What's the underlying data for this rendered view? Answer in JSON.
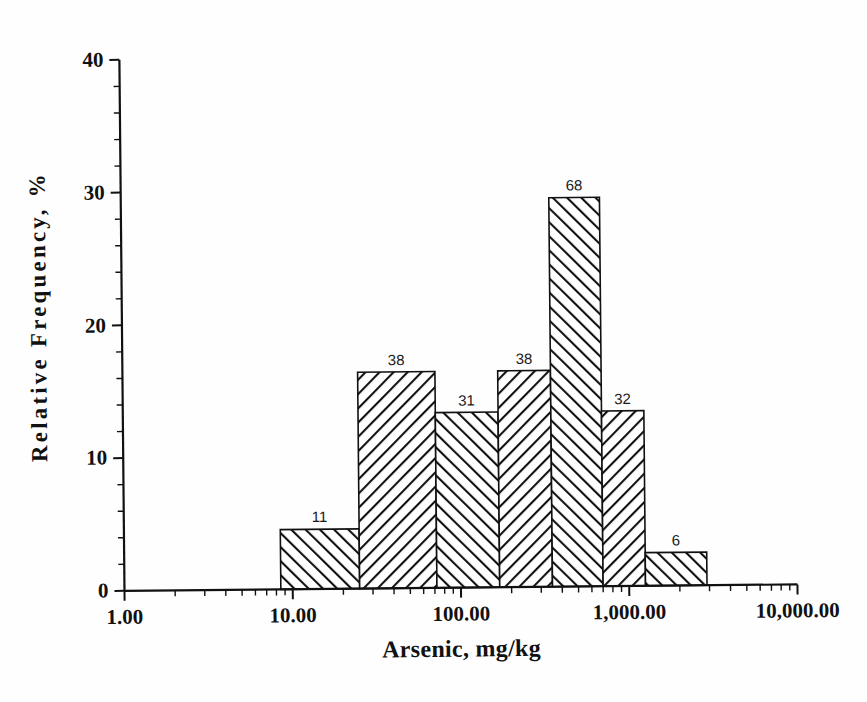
{
  "chart_data": {
    "type": "bar",
    "title": "",
    "xlabel": "Arsenic, mg/kg",
    "ylabel": "Relative Frequency, %",
    "xscale": "log",
    "xlim": [
      1,
      10000
    ],
    "ylim": [
      0,
      40
    ],
    "grid": false,
    "legend": null,
    "y_ticks": [
      0,
      10,
      20,
      30,
      40
    ],
    "y_tick_labels": [
      "0",
      "10",
      "20",
      "30",
      "40"
    ],
    "y_minor_step": 2,
    "x_ticks": [
      1,
      10,
      100,
      1000,
      10000
    ],
    "x_tick_labels": [
      "1.00",
      "10.00",
      "100.00",
      "1,000.00",
      "10,000.00"
    ],
    "bin_edges": [
      8.5,
      25,
      72,
      170,
      350,
      700,
      1250,
      2900
    ],
    "values": [
      4.5,
      16.3,
      13.2,
      16.3,
      29.3,
      13.2,
      2.5
    ],
    "counts": [
      11,
      38,
      31,
      38,
      68,
      32,
      6
    ],
    "count_labels": [
      "11",
      "38",
      "31",
      "38",
      "68",
      "32",
      "6"
    ],
    "hatch": [
      "\\",
      "/",
      "\\",
      "/",
      "\\",
      "/",
      "\\"
    ],
    "bar_edge_color": "#111111",
    "bar_face_color": "#ffffff",
    "hatch_color": "#111111",
    "axis_color": "#111111",
    "background_color": "#ffffff"
  }
}
